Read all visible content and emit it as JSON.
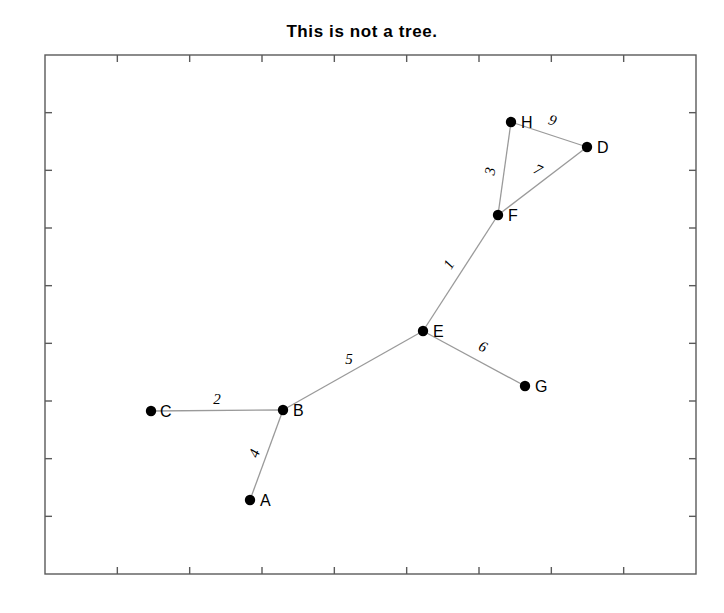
{
  "figure": {
    "title": "This is not a tree.",
    "background_color": "#ffffff",
    "frame_color": "#5a5a5a",
    "node_color": "#000000",
    "edge_color": "#9a9a9a",
    "label_color": "#000000"
  },
  "chart_data": {
    "type": "scatter",
    "title": "This is not a tree.",
    "xlabel": "",
    "ylabel": "",
    "grid": false,
    "legend": null,
    "axis": {
      "x_tick_count": 9,
      "y_tick_count": 9,
      "x_tick_labels": [],
      "y_tick_labels": [],
      "frame": true,
      "ticks_direction": "inward"
    },
    "graph": {
      "description": "Undirected weighted graph with 8 labelled nodes and 7 weighted edges; contains cycle H-D-F-H so it is not a tree.",
      "node_count": 8,
      "edge_count": 7,
      "nodes": [
        {
          "id": "A",
          "label": "A",
          "x": 250,
          "y": 500,
          "label_dx": 10,
          "label_dy": 6
        },
        {
          "id": "B",
          "label": "B",
          "x": 283,
          "y": 410,
          "label_dx": 10,
          "label_dy": 6
        },
        {
          "id": "C",
          "label": "C",
          "x": 151,
          "y": 411,
          "label_dx": 9,
          "label_dy": 6
        },
        {
          "id": "D",
          "label": "D",
          "x": 587,
          "y": 147,
          "label_dx": 10,
          "label_dy": 6
        },
        {
          "id": "E",
          "label": "E",
          "x": 423,
          "y": 331,
          "label_dx": 10,
          "label_dy": 6
        },
        {
          "id": "F",
          "label": "F",
          "x": 498,
          "y": 215,
          "label_dx": 10,
          "label_dy": 6
        },
        {
          "id": "G",
          "label": "G",
          "x": 525,
          "y": 386,
          "label_dx": 10,
          "label_dy": 6
        },
        {
          "id": "H",
          "label": "H",
          "x": 511,
          "y": 122,
          "label_dx": 10,
          "label_dy": 6
        }
      ],
      "edges": [
        {
          "source": "E",
          "target": "F",
          "weight": 1,
          "label": "1",
          "label_x": 453,
          "label_y": 267,
          "label_rotation": -58
        },
        {
          "source": "C",
          "target": "B",
          "weight": 2,
          "label": "2",
          "label_x": 217,
          "label_y": 404,
          "label_rotation": 0
        },
        {
          "source": "H",
          "target": "F",
          "weight": 3,
          "label": "3",
          "label_x": 495,
          "label_y": 172,
          "label_rotation": -80
        },
        {
          "source": "B",
          "target": "A",
          "weight": 4,
          "label": "4",
          "label_x": 259,
          "label_y": 455,
          "label_rotation": -70
        },
        {
          "source": "B",
          "target": "E",
          "weight": 5,
          "label": "5",
          "label_x": 349,
          "label_y": 364,
          "label_rotation": 0
        },
        {
          "source": "E",
          "target": "G",
          "weight": 6,
          "label": "6",
          "label_x": 481,
          "label_y": 351,
          "label_rotation": 25
        },
        {
          "source": "F",
          "target": "D",
          "weight": 7,
          "label": "7",
          "label_x": 536,
          "label_y": 174,
          "label_rotation": 25
        },
        {
          "source": "H",
          "target": "D",
          "weight": 9,
          "label": "9",
          "label_x": 551,
          "label_y": 125,
          "label_rotation": 18
        }
      ]
    }
  }
}
